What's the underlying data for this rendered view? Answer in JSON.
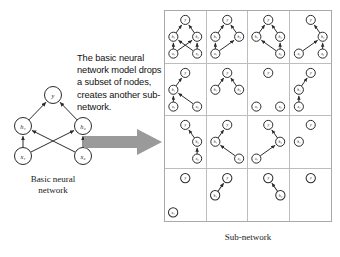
{
  "figure": {
    "explanation_text": "The basic neural network model drops a subset of nodes, creates another sub-network.",
    "arrow_icon": "right-arrow-icon",
    "left_caption_line1": "Basic neural",
    "left_caption_line2": "network",
    "right_caption": "Sub-network"
  },
  "basic_network": {
    "title": "Basic neural network",
    "nodes": [
      {
        "id": "y",
        "label": "y",
        "layer": "output",
        "x": 43,
        "y": 9
      },
      {
        "id": "h1",
        "label": "h₁",
        "layer": "hidden",
        "x": 13,
        "y": 40
      },
      {
        "id": "h2",
        "label": "h₂",
        "layer": "hidden",
        "x": 73,
        "y": 40
      },
      {
        "id": "x1",
        "label": "x₁",
        "layer": "input",
        "x": 13,
        "y": 70
      },
      {
        "id": "x2",
        "label": "x₂",
        "layer": "input",
        "x": 73,
        "y": 70
      }
    ],
    "edges": [
      {
        "from": "h1",
        "to": "y"
      },
      {
        "from": "h2",
        "to": "y"
      },
      {
        "from": "x1",
        "to": "h1"
      },
      {
        "from": "x1",
        "to": "h2"
      },
      {
        "from": "x2",
        "to": "h1"
      },
      {
        "from": "x2",
        "to": "h2"
      }
    ]
  },
  "subnetwork_grid": {
    "rows": 4,
    "cols": 4,
    "node_positions": {
      "y": {
        "x": 20,
        "y": 9
      },
      "h1": {
        "x": 8,
        "y": 26
      },
      "h2": {
        "x": 32,
        "y": 26
      },
      "x1": {
        "x": 8,
        "y": 43
      },
      "x2": {
        "x": 32,
        "y": 43
      }
    },
    "cells": [
      {
        "index": 1,
        "nodes": [
          "y",
          "h1",
          "h2",
          "x1",
          "x2"
        ],
        "edges": [
          [
            "h1",
            "y"
          ],
          [
            "h2",
            "y"
          ],
          [
            "x1",
            "h1"
          ],
          [
            "x1",
            "h2"
          ],
          [
            "x2",
            "h1"
          ],
          [
            "x2",
            "h2"
          ]
        ]
      },
      {
        "index": 2,
        "nodes": [
          "y",
          "h1",
          "h2",
          "x1"
        ],
        "edges": [
          [
            "h1",
            "y"
          ],
          [
            "h2",
            "y"
          ],
          [
            "x1",
            "h1"
          ],
          [
            "x1",
            "h2"
          ]
        ]
      },
      {
        "index": 3,
        "nodes": [
          "y",
          "h1",
          "h2",
          "x2"
        ],
        "edges": [
          [
            "h1",
            "y"
          ],
          [
            "h2",
            "y"
          ],
          [
            "x2",
            "h1"
          ],
          [
            "x2",
            "h2"
          ]
        ]
      },
      {
        "index": 4,
        "nodes": [
          "y",
          "h2",
          "x1",
          "x2"
        ],
        "edges": [
          [
            "h2",
            "y"
          ],
          [
            "x1",
            "h2"
          ],
          [
            "x2",
            "h2"
          ]
        ]
      },
      {
        "index": 5,
        "nodes": [
          "y",
          "h1",
          "x1",
          "x2"
        ],
        "edges": [
          [
            "h1",
            "y"
          ],
          [
            "x1",
            "h1"
          ],
          [
            "x2",
            "h1"
          ]
        ]
      },
      {
        "index": 6,
        "nodes": [
          "y",
          "h1",
          "h2"
        ],
        "edges": [
          [
            "h1",
            "y"
          ],
          [
            "h2",
            "y"
          ]
        ]
      },
      {
        "index": 7,
        "nodes": [
          "y",
          "x1",
          "x2"
        ],
        "edges": []
      },
      {
        "index": 8,
        "nodes": [
          "y",
          "h1",
          "x1"
        ],
        "edges": [
          [
            "h1",
            "y"
          ],
          [
            "x1",
            "h1"
          ]
        ]
      },
      {
        "index": 9,
        "nodes": [
          "y",
          "h2",
          "x2"
        ],
        "edges": [
          [
            "h2",
            "y"
          ],
          [
            "x2",
            "h2"
          ]
        ]
      },
      {
        "index": 10,
        "nodes": [
          "y",
          "h1",
          "x2"
        ],
        "edges": [
          [
            "h1",
            "y"
          ],
          [
            "x2",
            "h1"
          ]
        ]
      },
      {
        "index": 11,
        "nodes": [
          "y",
          "h2",
          "x1"
        ],
        "edges": [
          [
            "h2",
            "y"
          ],
          [
            "x1",
            "h2"
          ]
        ]
      },
      {
        "index": 12,
        "nodes": [
          "y",
          "h1"
        ],
        "edges": []
      },
      {
        "index": 13,
        "nodes": [
          "y",
          "x1"
        ],
        "edges": []
      },
      {
        "index": 14,
        "nodes": [
          "y",
          "h1"
        ],
        "edges": [
          [
            "h1",
            "y"
          ]
        ]
      },
      {
        "index": 15,
        "nodes": [
          "y",
          "h2"
        ],
        "edges": [
          [
            "h2",
            "y"
          ]
        ]
      },
      {
        "index": 16,
        "nodes": [
          "y"
        ],
        "edges": []
      }
    ]
  },
  "colors": {
    "node_stroke": "#2b2b2b",
    "node_fill": "#ffffff",
    "edge": "#2b2b2b",
    "grid_border": "#a8a8a8",
    "grid_inner": "#bdbdbd",
    "arrow_fill": "#9a9a9a",
    "text": "#111111"
  }
}
